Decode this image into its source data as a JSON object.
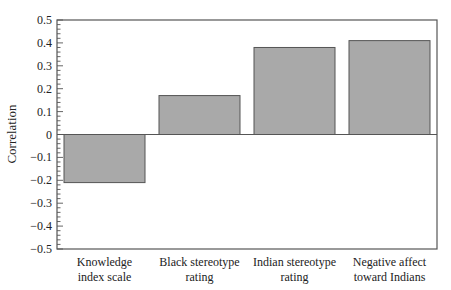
{
  "chart_data": {
    "type": "bar",
    "title": "",
    "xlabel": "",
    "ylabel": "Correlation",
    "categories": [
      [
        "Knowledge",
        "index scale"
      ],
      [
        "Black stereotype",
        "rating"
      ],
      [
        "Indian stereotype",
        "rating"
      ],
      [
        "Negative affect",
        "toward Indians"
      ]
    ],
    "category_names": [
      "Knowledge index scale",
      "Black stereotype rating",
      "Indian stereotype rating",
      "Negative affect toward Indians"
    ],
    "values": [
      -0.21,
      0.17,
      0.38,
      0.41
    ],
    "ylim": [
      -0.5,
      0.5
    ],
    "yticks": [
      0.5,
      0.4,
      0.3,
      0.2,
      0.1,
      0,
      -0.1,
      -0.2,
      -0.3,
      -0.4,
      -0.5
    ],
    "ytick_labels": [
      "0.5",
      "0.4",
      "0.3",
      "0.2",
      "0.1",
      "0",
      "−0.1",
      "−0.2",
      "−0.3",
      "−0.4",
      "−0.5"
    ],
    "minor_ticks_per_major": 5,
    "grid": false,
    "legend": null,
    "colors": {
      "bar_fill": "#a9a9a9",
      "bar_edge": "#555555",
      "axis": "#555555",
      "zero_line": "#555555"
    }
  }
}
